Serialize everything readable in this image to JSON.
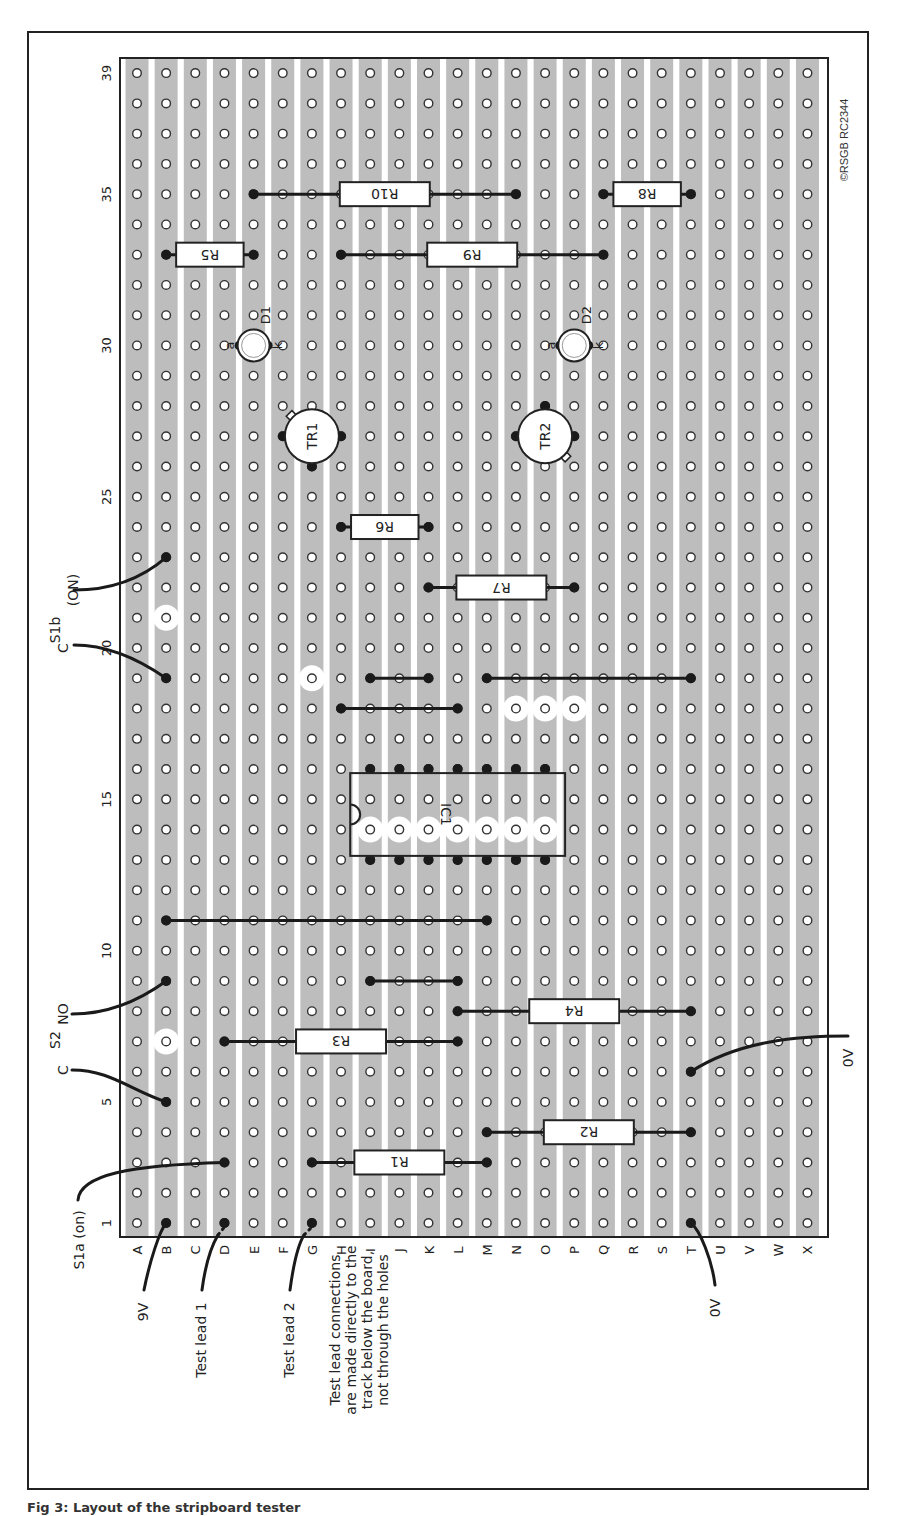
{
  "figure": {
    "copyright": "©RSGB RC2344",
    "caption": "Fig 3: Layout of the stripboard tester"
  },
  "board": {
    "columns": [
      "A",
      "B",
      "C",
      "D",
      "E",
      "F",
      "G",
      "H",
      "I",
      "J",
      "K",
      "L",
      "M",
      "N",
      "O",
      "P",
      "Q",
      "R",
      "S",
      "T",
      "U",
      "V",
      "W",
      "X"
    ],
    "row_count": 39,
    "row_labels": [
      {
        "row": 1,
        "label": "1"
      },
      {
        "row": 5,
        "label": "5"
      },
      {
        "row": 10,
        "label": "10"
      },
      {
        "row": 15,
        "label": "15"
      },
      {
        "row": 20,
        "label": "20"
      },
      {
        "row": 25,
        "label": "25"
      },
      {
        "row": 30,
        "label": "30"
      },
      {
        "row": 35,
        "label": "35"
      },
      {
        "row": 39,
        "label": "39"
      }
    ],
    "colors": {
      "strip": "#bdbdbd",
      "gap": "#ffffff",
      "hole_fill": "#ffffff",
      "hole_stroke": "#333333",
      "wire": "#1a1a1a"
    }
  },
  "track_cuts": [
    {
      "col": "B",
      "row": 7
    },
    {
      "col": "B",
      "row": 21
    },
    {
      "col": "G",
      "row": 19
    },
    {
      "col": "I",
      "row": 14
    },
    {
      "col": "J",
      "row": 14
    },
    {
      "col": "K",
      "row": 14
    },
    {
      "col": "L",
      "row": 14
    },
    {
      "col": "M",
      "row": 14
    },
    {
      "col": "N",
      "row": 14
    },
    {
      "col": "O",
      "row": 14
    },
    {
      "col": "N",
      "row": 18
    },
    {
      "col": "O",
      "row": 18
    },
    {
      "col": "P",
      "row": 18
    }
  ],
  "links": [
    {
      "from": [
        "B",
        11
      ],
      "to": [
        "M",
        11
      ]
    },
    {
      "from": [
        "I",
        9
      ],
      "to": [
        "L",
        9
      ]
    },
    {
      "from": [
        "H",
        18
      ],
      "to": [
        "L",
        18
      ]
    },
    {
      "from": [
        "I",
        19
      ],
      "to": [
        "K",
        19
      ]
    },
    {
      "from": [
        "M",
        19
      ],
      "to": [
        "T",
        19
      ]
    }
  ],
  "resistors": [
    {
      "label": "R1",
      "from": [
        "G",
        3
      ],
      "to": [
        "M",
        3
      ]
    },
    {
      "label": "R2",
      "from": [
        "M",
        4
      ],
      "to": [
        "T",
        4
      ]
    },
    {
      "label": "R3",
      "from": [
        "D",
        7
      ],
      "to": [
        "L",
        7
      ]
    },
    {
      "label": "R4",
      "from": [
        "L",
        8
      ],
      "to": [
        "T",
        8
      ]
    },
    {
      "label": "R5",
      "from": [
        "B",
        33
      ],
      "to": [
        "E",
        33
      ]
    },
    {
      "label": "R6",
      "from": [
        "H",
        24
      ],
      "to": [
        "K",
        24
      ]
    },
    {
      "label": "R7",
      "from": [
        "K",
        22
      ],
      "to": [
        "P",
        22
      ]
    },
    {
      "label": "R8",
      "from": [
        "Q",
        35
      ],
      "to": [
        "T",
        35
      ]
    },
    {
      "label": "R9",
      "from": [
        "H",
        33
      ],
      "to": [
        "Q",
        33
      ]
    },
    {
      "label": "R10",
      "from": [
        "E",
        35
      ],
      "to": [
        "N",
        35
      ]
    }
  ],
  "ic": {
    "label": "IC1",
    "pins": 14,
    "col_start": "I",
    "col_end": "O",
    "row_bottom": 13,
    "row_top": 16
  },
  "transistors": [
    {
      "label": "TR1",
      "col": "G",
      "row": 27
    },
    {
      "label": "TR2",
      "col": "O",
      "row": 27
    }
  ],
  "leds": [
    {
      "label": "D1",
      "anode": "a",
      "cathode": "k",
      "col": "E",
      "row": 30
    },
    {
      "label": "D2",
      "anode": "a",
      "cathode": "k",
      "col": "P",
      "row": 30
    }
  ],
  "annotations": {
    "s1b": "S1b",
    "s1b_on": "(ON)",
    "s1b_c": "C",
    "s2": "S2",
    "s2_no": "NO",
    "s2_c": "C",
    "s1a_on": "S1a (on)",
    "nine_v": "9V",
    "test_lead_1": "Test lead 1",
    "test_lead_2": "Test lead 2",
    "zero_v_bottom": "0V",
    "zero_v_right": "0V",
    "note_lines": [
      "Test lead connections",
      "are made directly to the",
      "track below the board,",
      "not through the holes"
    ]
  }
}
